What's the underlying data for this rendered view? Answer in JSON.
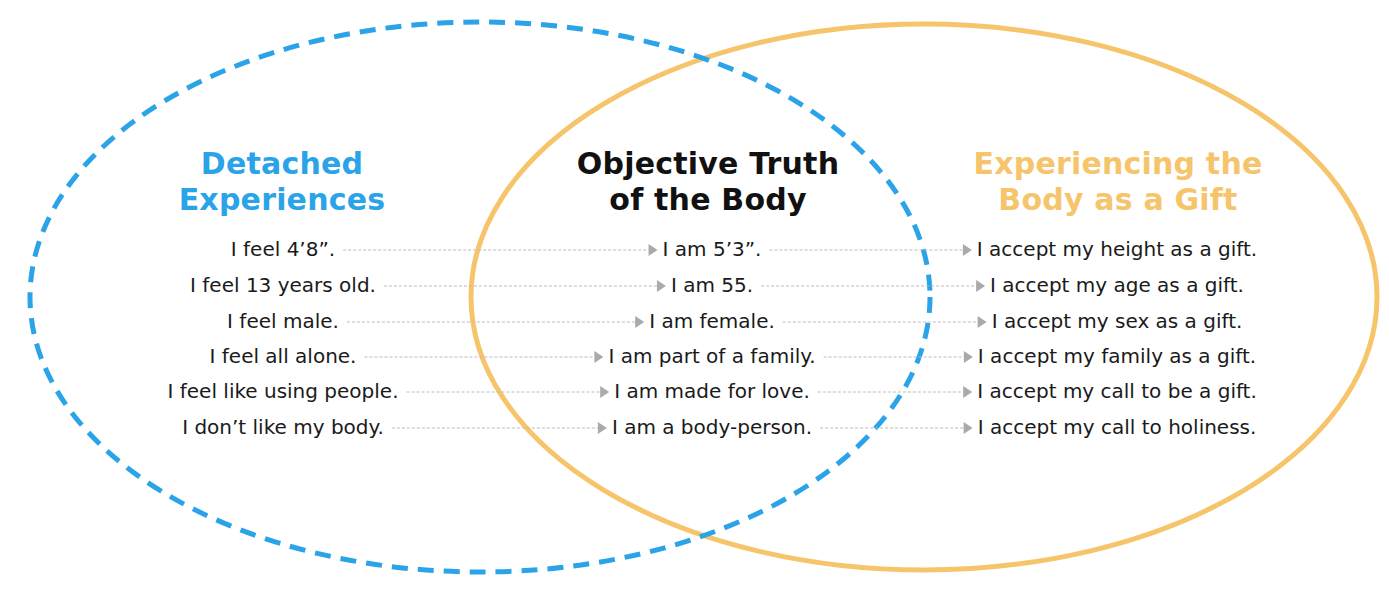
{
  "colors": {
    "detached": "#2ba3e8",
    "objective": "#111111",
    "gift": "#f6c56b",
    "connector": "#bcbcbc",
    "arrow": "#aaaaaa",
    "text": "#1a1a1a"
  },
  "columns": {
    "detached": {
      "title": [
        "Detached",
        "Experiences"
      ],
      "items": [
        "I feel 4’8”.",
        "I feel 13 years old.",
        "I feel male.",
        "I feel all alone.",
        "I feel like using people.",
        "I don’t like my body."
      ]
    },
    "objective": {
      "title": [
        "Objective Truth",
        "of the Body"
      ],
      "items": [
        "I am 5’3”.",
        "I am 55.",
        "I am female.",
        "I am part of a family.",
        "I am made for love.",
        "I am a body-person."
      ]
    },
    "gift": {
      "title": [
        "Experiencing the",
        "Body as a Gift"
      ],
      "items": [
        "I accept my height as a gift.",
        "I accept my age as a gift.",
        "I accept my sex as a gift.",
        "I accept my family as a gift.",
        "I accept my call to be a gift.",
        "I accept my call to holiness."
      ]
    }
  }
}
